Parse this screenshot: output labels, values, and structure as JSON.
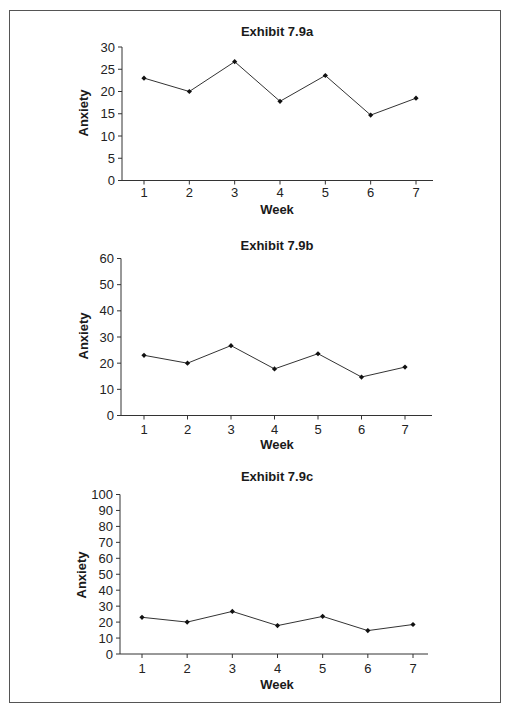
{
  "chart_data": [
    {
      "type": "line",
      "title": "Exhibit 7.9a",
      "xlabel": "Week",
      "ylabel": "Anxiety",
      "categories": [
        "1",
        "2",
        "3",
        "4",
        "5",
        "6",
        "7"
      ],
      "x": [
        1,
        2,
        3,
        4,
        5,
        6,
        7
      ],
      "values": [
        23,
        20,
        26.7,
        17.8,
        23.6,
        14.7,
        18.5
      ],
      "ylim": [
        0,
        30
      ],
      "yticks": [
        0,
        5,
        10,
        15,
        20,
        25,
        30
      ],
      "grid": false,
      "legend": null,
      "marker": "diamond",
      "color": "#333333"
    },
    {
      "type": "line",
      "title": "Exhibit 7.9b",
      "xlabel": "Week",
      "ylabel": "Anxiety",
      "categories": [
        "1",
        "2",
        "3",
        "4",
        "5",
        "6",
        "7"
      ],
      "x": [
        1,
        2,
        3,
        4,
        5,
        6,
        7
      ],
      "values": [
        23,
        20,
        26.7,
        17.8,
        23.6,
        14.7,
        18.5
      ],
      "ylim": [
        0,
        60
      ],
      "yticks": [
        0,
        10,
        20,
        30,
        40,
        50,
        60
      ],
      "grid": false,
      "legend": null,
      "marker": "diamond",
      "color": "#333333"
    },
    {
      "type": "line",
      "title": "Exhibit 7.9c",
      "xlabel": "Week",
      "ylabel": "Anxiety",
      "categories": [
        "1",
        "2",
        "3",
        "4",
        "5",
        "6",
        "7"
      ],
      "x": [
        1,
        2,
        3,
        4,
        5,
        6,
        7
      ],
      "values": [
        23,
        20,
        26.7,
        17.8,
        23.6,
        14.7,
        18.5
      ],
      "ylim": [
        0,
        100
      ],
      "yticks": [
        0,
        10,
        20,
        30,
        40,
        50,
        60,
        70,
        80,
        90,
        100
      ],
      "grid": false,
      "legend": null,
      "marker": "diamond",
      "color": "#333333"
    }
  ]
}
